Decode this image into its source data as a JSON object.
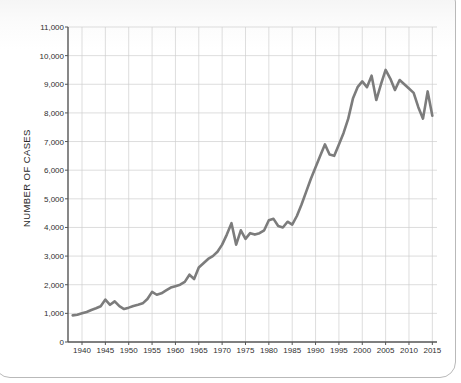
{
  "figure": {
    "background_color": "#ffffff",
    "frame_color": "#b9b9b9",
    "line_color": "#7c7c7c",
    "grid_color": "#cfcfcf",
    "axis_color": "#555555",
    "text_color": "#2f2f2f"
  },
  "chart_data": {
    "type": "line",
    "title": "",
    "xlabel": "",
    "ylabel": "NUMBER OF CASES",
    "xlim": [
      1937,
      2016
    ],
    "ylim": [
      0,
      11000
    ],
    "grid": true,
    "legend": "none",
    "y_ticks": [
      0,
      1000,
      2000,
      3000,
      4000,
      5000,
      6000,
      7000,
      8000,
      9000,
      10000,
      11000
    ],
    "y_tick_labels": [
      "0",
      "1,000",
      "2,000",
      "3,000",
      "4,000",
      "5,000",
      "6,000",
      "7,000",
      "8,000",
      "9,000",
      "10,000",
      "11,000"
    ],
    "x_ticks": [
      1940,
      1945,
      1950,
      1955,
      1960,
      1965,
      1970,
      1975,
      1980,
      1985,
      1990,
      1995,
      2000,
      2005,
      2010,
      2015
    ],
    "x_tick_labels": [
      "1940",
      "1945",
      "1950",
      "1955",
      "1960",
      "1965",
      "1970",
      "1975",
      "1980",
      "1985",
      "1990",
      "1995",
      "2000",
      "2005",
      "2010",
      "2015"
    ],
    "series": [
      {
        "name": "Number of cases",
        "x": [
          1938,
          1939,
          1940,
          1941,
          1942,
          1943,
          1944,
          1945,
          1946,
          1947,
          1948,
          1949,
          1950,
          1951,
          1952,
          1953,
          1954,
          1955,
          1956,
          1957,
          1958,
          1959,
          1960,
          1961,
          1962,
          1963,
          1964,
          1965,
          1966,
          1967,
          1968,
          1969,
          1970,
          1971,
          1972,
          1973,
          1974,
          1975,
          1976,
          1977,
          1978,
          1979,
          1980,
          1981,
          1982,
          1983,
          1984,
          1985,
          1986,
          1987,
          1988,
          1989,
          1990,
          1991,
          1992,
          1993,
          1994,
          1995,
          1996,
          1997,
          1998,
          1999,
          2000,
          2001,
          2002,
          2003,
          2004,
          2005,
          2006,
          2007,
          2008,
          2009,
          2010,
          2011,
          2012,
          2013,
          2014,
          2015
        ],
        "values": [
          930,
          950,
          1000,
          1050,
          1120,
          1180,
          1250,
          1480,
          1300,
          1420,
          1250,
          1150,
          1200,
          1260,
          1300,
          1350,
          1500,
          1750,
          1650,
          1700,
          1800,
          1900,
          1950,
          2000,
          2100,
          2350,
          2200,
          2600,
          2750,
          2900,
          3000,
          3150,
          3400,
          3750,
          4150,
          3400,
          3900,
          3600,
          3800,
          3750,
          3800,
          3900,
          4250,
          4300,
          4050,
          4000,
          4200,
          4100,
          4400,
          4800,
          5250,
          5700,
          6100,
          6500,
          6900,
          6550,
          6500,
          6900,
          7300,
          7800,
          8500,
          8900,
          9100,
          8900,
          9300,
          8450,
          9000,
          9500,
          9200,
          8800,
          9150,
          9000,
          8850,
          8700,
          8200,
          7800,
          8750,
          7900
        ]
      }
    ]
  }
}
